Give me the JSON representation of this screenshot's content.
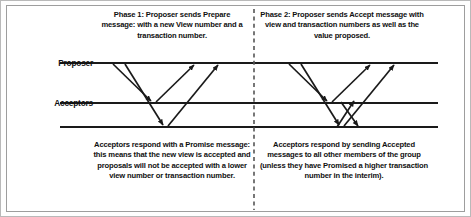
{
  "diagram": {
    "colors": {
      "line": "#1a1a1a",
      "text": "#101010",
      "divider": "#555555",
      "border": "#9d9d9d",
      "background": "#ffffff"
    },
    "lifelines": [
      {
        "id": "proposer",
        "label": "Proposer",
        "y": 62
      },
      {
        "id": "acceptors",
        "label": "Acceptors",
        "y": 102
      },
      {
        "id": "acceptors2",
        "label": "",
        "y": 126
      }
    ],
    "divider": {
      "style": "dashed",
      "x": 253,
      "orientation": "vertical"
    },
    "captions": {
      "phase1_top": "Phase 1: Proposer sends Prepare message: with a new View number and a transaction number.",
      "phase2_top": "Phase 2: Proposer sends Accept message with view and transaction numbers as well as the value proposed.",
      "phase1_bottom": "Acceptors respond with a Promise message: this means that the new view is accepted and proposals will not be accepted with a lower view number or transaction number.",
      "phase2_bottom": "Acceptors respond by sending Accepted messages to all other members of the group (unless they have Promised a higher transaction number in the interim)."
    },
    "messages": [
      {
        "phase": 1,
        "kind": "prepare",
        "from": "proposer",
        "to": "acceptors",
        "x1": 112,
        "y1": 63,
        "x2": 150,
        "y2": 101
      },
      {
        "phase": 1,
        "kind": "prepare",
        "from": "proposer",
        "to": "acceptors2",
        "x1": 124,
        "y1": 63,
        "x2": 162,
        "y2": 125
      },
      {
        "phase": 1,
        "kind": "promise",
        "from": "acceptors",
        "to": "proposer",
        "x1": 155,
        "y1": 101,
        "x2": 193,
        "y2": 63
      },
      {
        "phase": 1,
        "kind": "promise",
        "from": "acceptors2",
        "to": "proposer",
        "x1": 167,
        "y1": 125,
        "x2": 217,
        "y2": 63
      },
      {
        "phase": 2,
        "kind": "accept",
        "from": "proposer",
        "to": "acceptors",
        "x1": 288,
        "y1": 63,
        "x2": 326,
        "y2": 101
      },
      {
        "phase": 2,
        "kind": "accept",
        "from": "proposer",
        "to": "acceptors2",
        "x1": 300,
        "y1": 63,
        "x2": 338,
        "y2": 125
      },
      {
        "phase": 2,
        "kind": "accepted",
        "from": "acceptors",
        "to": "proposer",
        "x1": 331,
        "y1": 101,
        "x2": 369,
        "y2": 63
      },
      {
        "phase": 2,
        "kind": "accepted",
        "from": "acceptors2",
        "to": "proposer",
        "x1": 343,
        "y1": 125,
        "x2": 393,
        "y2": 63
      },
      {
        "phase": 2,
        "kind": "accepted",
        "from": "acceptors2",
        "to": "acceptors",
        "x1": 336,
        "y1": 125,
        "x2": 352,
        "y2": 101
      },
      {
        "phase": 2,
        "kind": "accepted",
        "from": "acceptors",
        "to": "acceptors2",
        "x1": 340,
        "y1": 101,
        "x2": 356,
        "y2": 125
      }
    ],
    "lifeline_extent": {
      "x_start": 59,
      "x_end": 437
    }
  }
}
